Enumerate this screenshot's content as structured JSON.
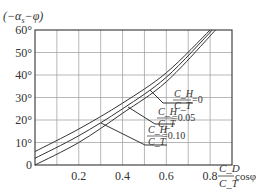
{
  "chart_data": {
    "type": "line",
    "title": "",
    "ylabel": "(−α_s−φ)",
    "xlabel": "C_D / C_T · cosφ",
    "xlim": [
      0,
      0.9
    ],
    "ylim": [
      0,
      60
    ],
    "grid": true,
    "x_ticks": [
      "0.2",
      "0.4",
      "0.6",
      "0.8"
    ],
    "y_ticks": [
      "0",
      "10°",
      "20°",
      "30°",
      "40°",
      "50°",
      "60°"
    ],
    "series": [
      {
        "name": "C_H/C_T = 0",
        "x": [
          0,
          0.2,
          0.4,
          0.6,
          0.8
        ],
        "values": [
          6,
          16,
          27.5,
          41,
          60
        ]
      },
      {
        "name": "C_H/C_T = 0.05",
        "x": [
          0,
          0.2,
          0.4,
          0.6,
          0.81
        ],
        "values": [
          3,
          13,
          25,
          39,
          60
        ]
      },
      {
        "name": "C_H/C_T = 0.10",
        "x": [
          0,
          0.2,
          0.4,
          0.6,
          0.825
        ],
        "values": [
          0,
          10,
          23,
          37,
          60
        ]
      }
    ],
    "annotations": [
      {
        "text": "C_H/C_T = 0",
        "num": "C_H",
        "den": "C_T",
        "value": "=0"
      },
      {
        "text": "C_H/C_T = 0.05",
        "num": "C_H",
        "den": "C_T",
        "value": "=0.05"
      },
      {
        "text": "C_H/C_T = 0.10",
        "num": "C_H",
        "den": "C_T",
        "value": "=0.10"
      }
    ],
    "xlabel_parts": {
      "num": "C_D",
      "den": "C_T",
      "suffix": "cosφ"
    },
    "ylabel_text": "(−α",
    "ylabel_sub": "s",
    "ylabel_tail": "−φ)"
  }
}
